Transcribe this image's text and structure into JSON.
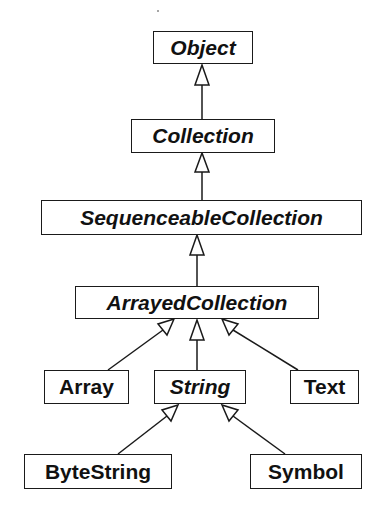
{
  "diagram": {
    "type": "class-hierarchy",
    "colors": {
      "line": "#1a1a1a",
      "text": "#111111",
      "background": "#ffffff"
    },
    "nodes": {
      "object": {
        "label": "Object",
        "abstract": true
      },
      "collection": {
        "label": "Collection",
        "abstract": true
      },
      "sequenceable_collection": {
        "label": "SequenceableCollection",
        "abstract": true
      },
      "arrayed_collection": {
        "label": "ArrayedCollection",
        "abstract": true
      },
      "array": {
        "label": "Array",
        "abstract": false
      },
      "string": {
        "label": "String",
        "abstract": true
      },
      "text": {
        "label": "Text",
        "abstract": false
      },
      "byte_string": {
        "label": "ByteString",
        "abstract": false
      },
      "symbol": {
        "label": "Symbol",
        "abstract": false
      }
    },
    "edges": [
      {
        "from": "Collection",
        "to": "Object",
        "kind": "inherits"
      },
      {
        "from": "SequenceableCollection",
        "to": "Collection",
        "kind": "inherits"
      },
      {
        "from": "ArrayedCollection",
        "to": "SequenceableCollection",
        "kind": "inherits"
      },
      {
        "from": "Array",
        "to": "ArrayedCollection",
        "kind": "inherits"
      },
      {
        "from": "String",
        "to": "ArrayedCollection",
        "kind": "inherits"
      },
      {
        "from": "Text",
        "to": "ArrayedCollection",
        "kind": "inherits"
      },
      {
        "from": "ByteString",
        "to": "String",
        "kind": "inherits"
      },
      {
        "from": "Symbol",
        "to": "String",
        "kind": "inherits"
      }
    ]
  }
}
